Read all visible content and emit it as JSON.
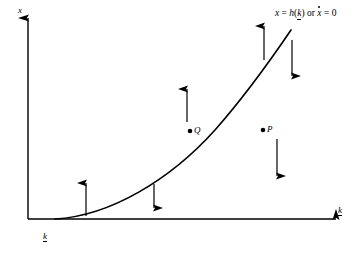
{
  "figure": {
    "type": "phase-diagram",
    "background": "#ffffff",
    "stroke_color": "#000000",
    "width": 361,
    "height": 254,
    "axes": {
      "vertical": {
        "label": "x",
        "label_x": 18,
        "label_y": 6,
        "x": 28,
        "y_top": 18,
        "y_bottom": 219
      },
      "horizontal": {
        "label": "k",
        "label_underlined": true,
        "label_x": 338,
        "label_y": 206,
        "y": 219,
        "x_left": 28,
        "x_right": 336
      }
    },
    "curve": {
      "label_prefix": "x",
      "label_eq1": " = ",
      "label_h": "h",
      "label_open": "(",
      "label_k": "k",
      "label_close": ")",
      "label_or": " or ",
      "label_xdot": "x",
      "label_eq2": " = 0",
      "label_zero": "0",
      "label_x": 275,
      "label_y": 9,
      "path": "M 55,219 C 110,216 170,180 215,130 C 245,96 272,58 291,30",
      "stroke_width": 1.6
    },
    "k_underbar": {
      "label": "k",
      "x": 43,
      "y": 232
    },
    "points": [
      {
        "name": "Q",
        "label": "Q",
        "cx": 190,
        "cy": 131,
        "label_x": 194,
        "label_y": 126
      },
      {
        "name": "P",
        "label": "P",
        "cx": 263,
        "cy": 130,
        "label_x": 267,
        "label_y": 125
      }
    ],
    "arrows": [
      {
        "name": "arrow-up-lower-left",
        "direction": "up",
        "x": 86,
        "y_tail": 216,
        "y_head": 183
      },
      {
        "name": "arrow-down-mid-lower",
        "direction": "down",
        "x": 154,
        "y_tail": 184,
        "y_head": 208
      },
      {
        "name": "arrow-up-above-q",
        "direction": "up",
        "x": 187,
        "y_tail": 122,
        "y_head": 89
      },
      {
        "name": "arrow-down-below-p",
        "direction": "down",
        "x": 277,
        "y_tail": 139,
        "y_head": 176
      },
      {
        "name": "arrow-up-upper-left",
        "direction": "up",
        "x": 264,
        "y_tail": 60,
        "y_head": 26
      },
      {
        "name": "arrow-down-upper-right",
        "direction": "down",
        "x": 292,
        "y_tail": 40,
        "y_head": 76
      }
    ]
  }
}
